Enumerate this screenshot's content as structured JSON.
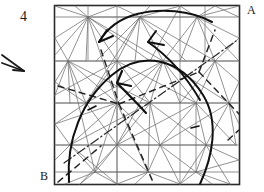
{
  "figure": {
    "number_label": "4",
    "corner_label_top_right": "A",
    "corner_label_bottom_left": "B",
    "frame": {
      "x": 54,
      "y": 5,
      "width": 186,
      "height": 180
    },
    "colors": {
      "ink": "#1a1a1a",
      "mesh_line": "#6b6b6b",
      "grid_line": "#8a8a8a",
      "frame": "#2b2b2b",
      "background": "#ffffff"
    },
    "external_arrow": {
      "name": "flow-direction-arrow",
      "from_x": 2,
      "from_y": 55,
      "to_x": 24,
      "to_y": 71
    },
    "grid_lines_y": [
      17,
      61,
      103,
      145,
      172
    ],
    "grid_lines_x": [
      54,
      117,
      180,
      240
    ],
    "mesh_nodes": [
      [
        88,
        17
      ],
      [
        140,
        17
      ],
      [
        197,
        17
      ],
      [
        68,
        61
      ],
      [
        117,
        61
      ],
      [
        163,
        61
      ],
      [
        215,
        61
      ],
      [
        86,
        103
      ],
      [
        117,
        103
      ],
      [
        150,
        103
      ],
      [
        196,
        103
      ],
      [
        229,
        103
      ],
      [
        70,
        145
      ],
      [
        117,
        145
      ],
      [
        160,
        145
      ],
      [
        206,
        145
      ],
      [
        236,
        145
      ],
      [
        95,
        172
      ],
      [
        148,
        172
      ],
      [
        196,
        172
      ],
      [
        54,
        38
      ],
      [
        54,
        82
      ],
      [
        54,
        124
      ],
      [
        54,
        160
      ],
      [
        240,
        38
      ],
      [
        240,
        82
      ],
      [
        240,
        124
      ],
      [
        240,
        160
      ],
      [
        117,
        5
      ],
      [
        180,
        5
      ],
      [
        117,
        185
      ],
      [
        180,
        185
      ]
    ],
    "curves": [
      {
        "name": "main-dome-arc",
        "description": "thick arc from lower-left rising over the top and descending to lower-right"
      },
      {
        "name": "upper-sweep-arc",
        "description": "thick arc across upper region ending with arrowhead at left"
      },
      {
        "name": "inner-arrow-curve",
        "description": "thick curved arrow from right-center up to mid-left arrowhead"
      },
      {
        "name": "short-arrow-curve",
        "description": "short thick curved arrow pointing up-left at mid-left"
      }
    ],
    "dash_dot_line": {
      "name": "dash-dot-diagonal",
      "from_x": 64,
      "from_y": 163,
      "to_x": 236,
      "to_y": 41
    },
    "dashed_lines": [
      {
        "from_x": 60,
        "from_y": 88,
        "to_x": 120,
        "to_y": 103
      },
      {
        "from_x": 120,
        "from_y": 103,
        "to_x": 196,
        "to_y": 74
      },
      {
        "from_x": 120,
        "from_y": 103,
        "to_x": 152,
        "to_y": 178
      },
      {
        "from_x": 103,
        "from_y": 55,
        "to_x": 120,
        "to_y": 103
      },
      {
        "from_x": 196,
        "from_y": 74,
        "to_x": 238,
        "to_y": 116
      },
      {
        "from_x": 60,
        "from_y": 180,
        "to_x": 100,
        "to_y": 148
      }
    ]
  }
}
